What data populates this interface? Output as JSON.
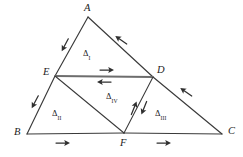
{
  "figure": {
    "background_color": "#ffffff",
    "line_color": "#3a3a3a",
    "midline_color": "#6d6d6d",
    "arrow_color": "#2f2f2f"
  },
  "vertices": [
    {
      "id": "A",
      "label": "A",
      "x": 88,
      "y": 17,
      "label_x": 84,
      "label_y": 3
    },
    {
      "id": "B",
      "label": "B",
      "x": 27,
      "y": 134,
      "label_x": 14,
      "label_y": 127
    },
    {
      "id": "C",
      "label": "C",
      "x": 222,
      "y": 134,
      "label_x": 228,
      "label_y": 126
    },
    {
      "id": "D",
      "label": "D",
      "x": 153,
      "y": 77,
      "label_x": 157,
      "label_y": 65
    },
    {
      "id": "E",
      "label": "E",
      "x": 55,
      "y": 76,
      "label_x": 43,
      "label_y": 67
    },
    {
      "id": "F",
      "label": "F",
      "x": 124,
      "y": 133,
      "label_x": 120,
      "label_y": 138
    }
  ],
  "segments": [
    {
      "name": "segment-AE",
      "from": "A",
      "to": "E",
      "style": "edge"
    },
    {
      "name": "segment-EB",
      "from": "E",
      "to": "B",
      "style": "edge"
    },
    {
      "name": "segment-AD",
      "from": "A",
      "to": "D",
      "style": "edge"
    },
    {
      "name": "segment-DC",
      "from": "D",
      "to": "C",
      "style": "edge"
    },
    {
      "name": "segment-BF",
      "from": "B",
      "to": "F",
      "style": "edge"
    },
    {
      "name": "segment-FC",
      "from": "F",
      "to": "C",
      "style": "edge"
    },
    {
      "name": "segment-ED",
      "from": "E",
      "to": "D",
      "style": "midline"
    },
    {
      "name": "segment-EF",
      "from": "E",
      "to": "F",
      "style": "inner"
    },
    {
      "name": "segment-DF",
      "from": "D",
      "to": "F",
      "style": "inner"
    }
  ],
  "triangle_labels": [
    {
      "name": "triangle-label-I",
      "delta": "Δ",
      "numeral": "I",
      "x": 83,
      "y": 49
    },
    {
      "name": "triangle-label-II",
      "delta": "Δ",
      "numeral": "II",
      "x": 52,
      "y": 109
    },
    {
      "name": "triangle-label-III",
      "delta": "Δ",
      "numeral": "III",
      "x": 155,
      "y": 109
    },
    {
      "name": "triangle-label-IV",
      "delta": "Δ",
      "numeral": "IV",
      "x": 106,
      "y": 92
    }
  ],
  "direction_arrows": [
    {
      "name": "arrow-on-AE",
      "x": 65,
      "y": 45,
      "angle": 118,
      "description": "points from A toward E"
    },
    {
      "name": "arrow-on-EB",
      "x": 35,
      "y": 102,
      "angle": 118,
      "description": "points from E toward B"
    },
    {
      "name": "arrow-on-AD",
      "x": 121,
      "y": 40,
      "angle": 215,
      "description": "points from D toward A"
    },
    {
      "name": "arrow-on-DC",
      "x": 186,
      "y": 92,
      "angle": 215,
      "description": "points from C toward D"
    },
    {
      "name": "arrow-above-ED",
      "x": 107,
      "y": 70,
      "angle": 0,
      "description": "points from E toward D"
    },
    {
      "name": "arrow-below-ED",
      "x": 104,
      "y": 82,
      "angle": 180,
      "description": "points from D toward E"
    },
    {
      "name": "arrow-left-of-DF",
      "x": 134,
      "y": 108,
      "angle": 292,
      "description": "points from F toward D"
    },
    {
      "name": "arrow-right-of-DF",
      "x": 144,
      "y": 108,
      "angle": 112,
      "description": "points from D toward F"
    },
    {
      "name": "arrow-on-BF",
      "x": 63,
      "y": 143,
      "angle": 0,
      "description": "points from B toward F"
    },
    {
      "name": "arrow-on-FC",
      "x": 164,
      "y": 143,
      "angle": 0,
      "description": "points from F toward C"
    }
  ]
}
